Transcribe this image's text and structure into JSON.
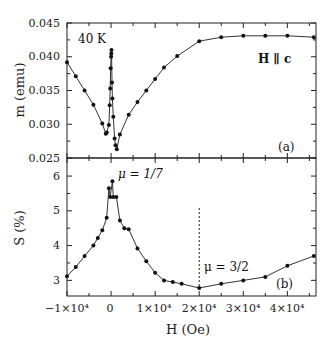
{
  "chart_data": [
    {
      "type": "line",
      "panel": "(a)",
      "title": "",
      "xlabel": "H (Oe)",
      "ylabel": "m (emu)",
      "xlim": [
        -10000,
        46500
      ],
      "ylim": [
        0.025,
        0.045
      ],
      "yticks": [
        0.025,
        0.03,
        0.035,
        0.04,
        0.045
      ],
      "ytick_labels": [
        "0.025",
        "0.030",
        "0.035",
        "0.040",
        "0.045"
      ],
      "annotations": [
        "40 K",
        "H ∥ c",
        "(a)"
      ],
      "grid": false,
      "series": [
        {
          "name": "m",
          "x": [
            -10000,
            -8000,
            -6000,
            -4000,
            -2000,
            -1200,
            -1000,
            -500,
            -300,
            -200,
            -100,
            0,
            50,
            100,
            200,
            300,
            500,
            800,
            1000,
            1300,
            2000,
            4000,
            6000,
            8000,
            10000,
            12000,
            15000,
            20000,
            25000,
            30000,
            35000,
            40000,
            46000
          ],
          "values": [
            0.0392,
            0.0371,
            0.035,
            0.0329,
            0.0301,
            0.0286,
            0.0288,
            0.0299,
            0.0328,
            0.0353,
            0.0383,
            0.04,
            0.0405,
            0.041,
            0.0362,
            0.0338,
            0.0311,
            0.0279,
            0.0269,
            0.0263,
            0.0285,
            0.0314,
            0.0333,
            0.035,
            0.0367,
            0.0384,
            0.0401,
            0.0423,
            0.0429,
            0.0431,
            0.0431,
            0.0431,
            0.0429
          ]
        }
      ]
    },
    {
      "type": "line",
      "panel": "(b)",
      "title": "",
      "xlabel": "H (Oe)",
      "ylabel": "S (%)",
      "xlim": [
        -10000,
        46500
      ],
      "ylim": [
        2.55,
        6.3
      ],
      "yticks": [
        3,
        4,
        5,
        6
      ],
      "ytick_labels": [
        "3",
        "4",
        "5",
        "6"
      ],
      "xticks": [
        -10000,
        0,
        10000,
        20000,
        30000,
        40000
      ],
      "xtick_labels": [
        "−1×10⁴",
        "0",
        "1×10⁴",
        "2×10⁴",
        "3×10⁴",
        "4×10⁴"
      ],
      "annotations": [
        "μ = 1/7",
        "μ = 3/2",
        "(b)"
      ],
      "vertical_dashed_line_x": 20000,
      "grid": false,
      "series": [
        {
          "name": "S",
          "x": [
            -10000,
            -8000,
            -6000,
            -4000,
            -3000,
            -2000,
            -1000,
            -500,
            -200,
            300,
            500,
            1200,
            2000,
            3000,
            4000,
            6000,
            8000,
            10000,
            12000,
            14000,
            16000,
            20000,
            25000,
            30000,
            35000,
            40000,
            46000
          ],
          "values": [
            3.12,
            3.38,
            3.7,
            4.0,
            4.22,
            4.44,
            4.8,
            5.65,
            5.4,
            5.85,
            5.4,
            5.4,
            4.72,
            4.5,
            4.47,
            3.92,
            3.55,
            3.22,
            3.0,
            2.95,
            2.9,
            2.78,
            2.9,
            3.0,
            3.1,
            3.42,
            3.7
          ]
        }
      ]
    }
  ],
  "labels": {
    "panel_a": {
      "ylabel": "m (emu)",
      "temp": "40 K",
      "orientation": "H ∥ c",
      "tag": "(a)",
      "yticks": [
        "0.045",
        "0.040",
        "0.035",
        "0.030",
        "0.025"
      ]
    },
    "panel_b": {
      "ylabel": "S (%)",
      "mu1": "μ = 1/7",
      "mu2": "μ = 3/2",
      "tag": "(b)",
      "yticks": [
        "6",
        "5",
        "4",
        "3"
      ]
    },
    "xaxis": {
      "label": "H (Oe)",
      "ticks": [
        "−1×10⁴",
        "0",
        "1×10⁴",
        "2×10⁴",
        "3×10⁴",
        "4×10⁴"
      ]
    }
  },
  "colors": {
    "line": "#333333",
    "marker": "#111111",
    "axis": "#222222",
    "background": "#ffffff"
  }
}
